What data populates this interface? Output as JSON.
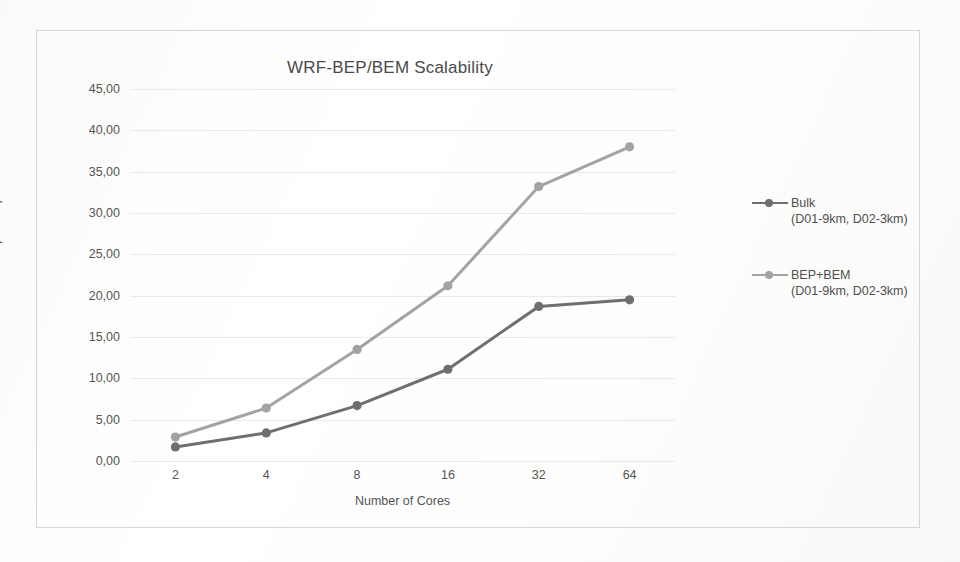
{
  "chart_data": {
    "type": "line",
    "title": "WRF-BEP/BEM Scalability",
    "xlabel": "Number of Cores",
    "ylabel": "Speed Up",
    "categories": [
      "2",
      "4",
      "8",
      "16",
      "32",
      "64"
    ],
    "ylim": [
      0,
      45
    ],
    "ytick_labels": [
      "0,00",
      "5,00",
      "10,00",
      "15,00",
      "20,00",
      "25,00",
      "30,00",
      "35,00",
      "40,00",
      "45,00"
    ],
    "ytick_values": [
      0,
      5,
      10,
      15,
      20,
      25,
      30,
      35,
      40,
      45
    ],
    "grid": true,
    "legend_position": "right",
    "series": [
      {
        "name": "Bulk",
        "sublabel": "(D01-9km, D02-3km)",
        "color": "#6f6f6f",
        "values": [
          1.7,
          3.4,
          6.7,
          11.1,
          18.7,
          19.5
        ]
      },
      {
        "name": "BEP+BEM",
        "sublabel": "(D01-9km, D02-3km)",
        "color": "#a3a3a3",
        "values": [
          2.9,
          6.4,
          13.5,
          21.2,
          33.2,
          38.0
        ]
      }
    ]
  },
  "colors": {
    "frame": "#d6d6d6",
    "grid": "#e9e9e9",
    "text": "#555555",
    "title": "#4a4a4a"
  }
}
